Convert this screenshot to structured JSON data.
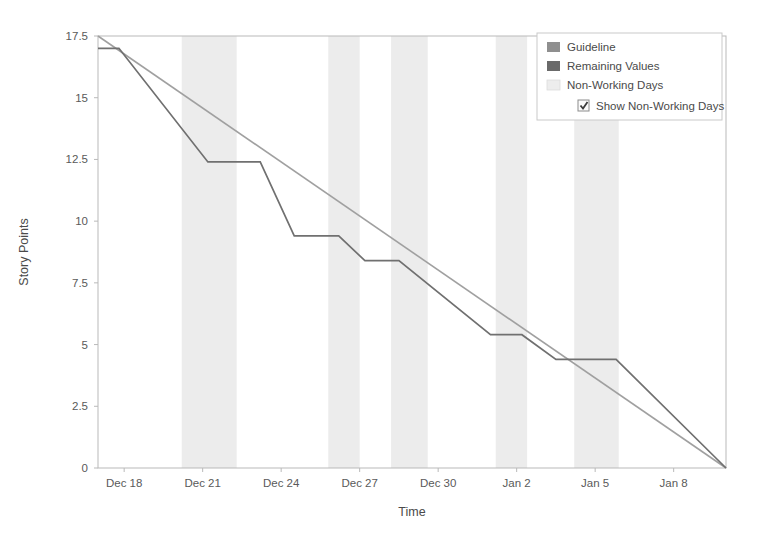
{
  "chart_data": {
    "type": "line",
    "title": "",
    "subtitle": "",
    "xlabel": "Time",
    "ylabel": "Story Points",
    "grid": false,
    "legend_position": "top-right",
    "xlim": [
      0,
      24
    ],
    "ylim": [
      0,
      17.5
    ],
    "x_tick_labels": [
      "Dec 18",
      "Dec 21",
      "Dec 24",
      "Dec 27",
      "Dec 30",
      "Jan 2",
      "Jan 5",
      "Jan 8"
    ],
    "x_tick_values": [
      1,
      4,
      7,
      10,
      13,
      16,
      19,
      22
    ],
    "y_tick_labels": [
      "0",
      "2.5",
      "5",
      "7.5",
      "10",
      "12.5",
      "15",
      "17.5"
    ],
    "y_tick_values": [
      0,
      2.5,
      5,
      7.5,
      10,
      12.5,
      15,
      17.5
    ],
    "series": [
      {
        "name": "Guideline",
        "color": "#a0a0a0",
        "x": [
          0,
          24
        ],
        "values": [
          17.5,
          0
        ]
      },
      {
        "name": "Remaining Values",
        "color": "#707070",
        "x": [
          0,
          0.8,
          4.2,
          6.2,
          7.5,
          9.2,
          10.2,
          11.5,
          15.0,
          16.2,
          17.5,
          19.8,
          24.0
        ],
        "values": [
          17.0,
          17.0,
          12.4,
          12.4,
          9.4,
          9.4,
          8.4,
          8.4,
          5.4,
          5.4,
          4.4,
          4.4,
          0.0
        ]
      }
    ],
    "non_working_day_bands": [
      {
        "start": 3.2,
        "end": 5.3
      },
      {
        "start": 8.8,
        "end": 10.0
      },
      {
        "start": 11.2,
        "end": 12.6
      },
      {
        "start": 15.2,
        "end": 16.4
      },
      {
        "start": 18.2,
        "end": 19.9
      }
    ],
    "annotations": []
  },
  "legend": {
    "items": [
      {
        "label": "Guideline",
        "swatch_color": "#8f8f8f",
        "swatch_type": "filled"
      },
      {
        "label": "Remaining Values",
        "swatch_color": "#6a6a6a",
        "swatch_type": "filled"
      },
      {
        "label": "Non-Working Days",
        "swatch_color": "#ededed",
        "swatch_type": "filled"
      }
    ],
    "checkbox": {
      "label": "Show Non-Working Days",
      "checked": true
    }
  },
  "axes": {
    "x_title": "Time",
    "y_title": "Story Points"
  }
}
